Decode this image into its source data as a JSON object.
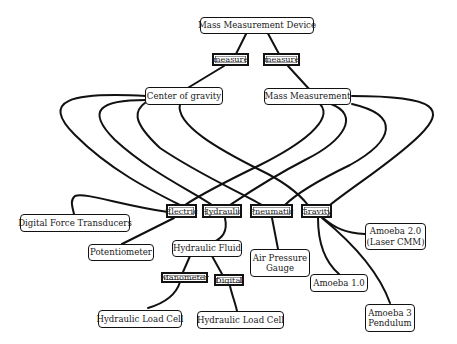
{
  "diagram": {
    "type": "concept-map",
    "root": {
      "label": "Mass Measurement Device"
    },
    "relations": [
      {
        "label": "measure"
      },
      {
        "label": "measure"
      }
    ],
    "middle": [
      {
        "label": "Center of gravity"
      },
      {
        "label": "Mass Measurement"
      }
    ],
    "categories": [
      {
        "label": "Electric"
      },
      {
        "label": "Hydraulic"
      },
      {
        "label": "Pneumatic"
      },
      {
        "label": "Gravity"
      }
    ],
    "electric_children": [
      {
        "label": "Digital Force Transducers"
      },
      {
        "label": "Potentiometer"
      }
    ],
    "hydraulic_children": [
      {
        "label": "Hydraulic Fluid"
      }
    ],
    "hydraulic_fluid_relations": [
      {
        "label": "Manometer"
      },
      {
        "label": "Digital"
      }
    ],
    "hydraulic_leaves": [
      {
        "label": "Hydraulic Load Cell"
      },
      {
        "label": "Hydraulic Load Cell"
      }
    ],
    "pneumatic_children": [
      {
        "label": "Air Pressure Gauge"
      }
    ],
    "gravity_children": [
      {
        "label": "Amoeba 2.0 (Laser CMM)"
      },
      {
        "label": "Amoeba 1.0"
      },
      {
        "label": "Amoeba 3 Pendulum"
      }
    ],
    "colors": {
      "line": "#111111",
      "node_fill": "#ffffff",
      "text": "#1a1a1a"
    }
  }
}
